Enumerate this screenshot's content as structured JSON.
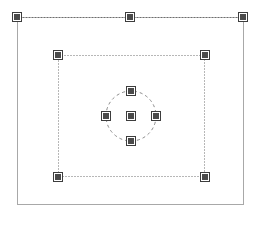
{
  "canvas": {
    "width": 259,
    "height": 226,
    "background_color": "#ffffff",
    "title": "Selection Handles Canvas"
  },
  "colors": {
    "frame_stroke": "#a8a8a8",
    "guide_stroke": "#6e6e6e",
    "circle_stroke": "#8a8a8a",
    "handle_fill": "#4a4a4a",
    "handle_border": "#ffffff",
    "handle_outline": "#3d3d3d"
  },
  "frame": {
    "name": "outer-frame",
    "x": 17,
    "y": 17,
    "width": 227,
    "height": 188,
    "stroke_width": 1,
    "stroke_style": "solid"
  },
  "shapes": [
    {
      "id": "top-guide-line",
      "type": "line",
      "label": "Top dotted guide line",
      "x1": 17,
      "y1": 17,
      "x2": 243,
      "y2": 17,
      "stroke_style": "dotted",
      "stroke_width": 1,
      "dash_pattern": "1 2"
    },
    {
      "id": "inner-rectangle",
      "type": "rect",
      "label": "Inner dotted rectangle",
      "x": 58,
      "y": 55,
      "width": 147,
      "height": 122,
      "stroke_style": "dotted",
      "stroke_width": 1,
      "dash_pattern": "1 2"
    },
    {
      "id": "center-circle",
      "type": "circle",
      "label": "Center dashed circle",
      "cx": 131,
      "cy": 116,
      "r": 25,
      "stroke_style": "dashed",
      "stroke_width": 1,
      "dash_pattern": "3 3"
    }
  ],
  "handles": [
    {
      "id": "handle-top-left",
      "group": "top-guide-line",
      "role": "endpoint",
      "cx": 17,
      "cy": 17,
      "size": 8
    },
    {
      "id": "handle-top-center",
      "group": "top-guide-line",
      "role": "midpoint",
      "cx": 130,
      "cy": 17,
      "size": 8
    },
    {
      "id": "handle-top-right",
      "group": "top-guide-line",
      "role": "endpoint",
      "cx": 243,
      "cy": 17,
      "size": 8
    },
    {
      "id": "handle-rect-top-left",
      "group": "inner-rectangle",
      "role": "corner",
      "cx": 58,
      "cy": 55,
      "size": 8
    },
    {
      "id": "handle-rect-top-right",
      "group": "inner-rectangle",
      "role": "corner",
      "cx": 205,
      "cy": 55,
      "size": 8
    },
    {
      "id": "handle-rect-bottom-left",
      "group": "inner-rectangle",
      "role": "corner",
      "cx": 58,
      "cy": 177,
      "size": 8
    },
    {
      "id": "handle-rect-bottom-right",
      "group": "inner-rectangle",
      "role": "corner",
      "cx": 205,
      "cy": 177,
      "size": 8
    },
    {
      "id": "handle-circle-top",
      "group": "center-circle",
      "role": "cardinal",
      "cx": 131,
      "cy": 91,
      "size": 8
    },
    {
      "id": "handle-circle-left",
      "group": "center-circle",
      "role": "cardinal",
      "cx": 106,
      "cy": 116,
      "size": 8
    },
    {
      "id": "handle-circle-center",
      "group": "center-circle",
      "role": "center",
      "cx": 131,
      "cy": 116,
      "size": 8
    },
    {
      "id": "handle-circle-right",
      "group": "center-circle",
      "role": "cardinal",
      "cx": 156,
      "cy": 116,
      "size": 8
    },
    {
      "id": "handle-circle-bottom",
      "group": "center-circle",
      "role": "cardinal",
      "cx": 131,
      "cy": 141,
      "size": 8
    }
  ]
}
